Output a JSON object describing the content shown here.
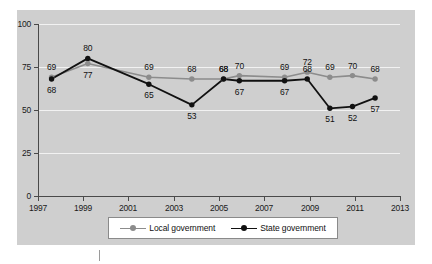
{
  "chart_data": {
    "type": "line",
    "title": "",
    "xlabel": "",
    "ylabel": "",
    "xlim": [
      1997,
      2013
    ],
    "ylim": [
      0,
      100
    ],
    "grid": true,
    "legend_position": "bottom-center",
    "x_ticks": [
      "1997",
      "1999",
      "2001",
      "2003",
      "2005",
      "2007",
      "2009",
      "2011",
      "2013"
    ],
    "x_tick_values": [
      1997,
      1999,
      2001,
      2003,
      2005,
      2007,
      2009,
      2011,
      2013
    ],
    "y_ticks": [
      "0",
      "25",
      "50",
      "75",
      "100"
    ],
    "y_tick_values": [
      0,
      25,
      50,
      75,
      100
    ],
    "x": [
      1997.6,
      1999.2,
      1999.2,
      2001.9,
      2003.8,
      2005.2,
      2005.9,
      2007.9,
      2008.9,
      2009.9,
      2010.9,
      2011.9
    ],
    "series": [
      {
        "name": "Local government",
        "color": "#8c8c8c",
        "marker": "circle",
        "x": [
          1997.6,
          1999.2,
          2001.9,
          2003.8,
          2005.2,
          2005.9,
          2007.9,
          2008.9,
          2009.9,
          2010.9,
          2011.9
        ],
        "values": [
          69,
          77,
          69,
          68,
          68,
          70,
          69,
          72,
          69,
          70,
          68
        ],
        "labels": [
          "69",
          "77",
          "69",
          "68",
          "68",
          "70",
          "69",
          "72",
          "69",
          "70",
          "68"
        ]
      },
      {
        "name": "State government",
        "color": "#111111",
        "marker": "circle",
        "x": [
          1997.6,
          1999.2,
          2001.9,
          2003.8,
          2005.2,
          2005.9,
          2007.9,
          2008.9,
          2009.9,
          2010.9,
          2011.9
        ],
        "values": [
          68,
          80,
          65,
          53,
          68,
          67,
          67,
          68,
          51,
          52,
          57
        ],
        "labels": [
          "68",
          "80",
          "65",
          "53",
          "68",
          "67",
          "67",
          "68",
          "51",
          "52",
          "57"
        ]
      }
    ],
    "annotations": {
      "local_label_offsets": [
        "above",
        "below",
        "above",
        "above",
        "above",
        "above",
        "above",
        "above",
        "above",
        "above",
        "above"
      ],
      "state_label_offsets": [
        "below",
        "above",
        "below",
        "below",
        "above",
        "below",
        "below",
        "above",
        "below",
        "below",
        "below"
      ]
    }
  },
  "legend": {
    "items": [
      {
        "label": "Local government",
        "color": "#8c8c8c"
      },
      {
        "label": "State government",
        "color": "#111111"
      }
    ]
  },
  "colors": {
    "panel_background": "#cfcfcf",
    "page_background": "#ffffff",
    "gridline": "#f2f2f2",
    "axis": "#4a4a4a",
    "local_series": "#8c8c8c",
    "state_series": "#111111",
    "legend_border": "#8a8a8a",
    "text": "#111111"
  }
}
